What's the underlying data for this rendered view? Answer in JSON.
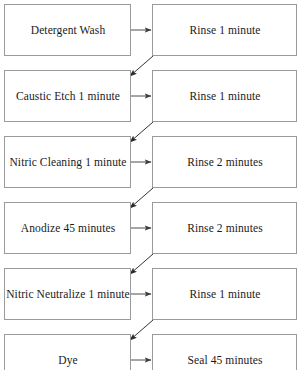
{
  "diagram": {
    "type": "flowchart",
    "orientation": "two-column-zigzag",
    "title_visible": false,
    "cropped_top": true,
    "cropped_bottom": true,
    "colors": {
      "box_border": "#9a9a9a",
      "box_fill": "#ffffff",
      "arrow": "#4d4d4d",
      "diagonal_arrow": "#333333",
      "text": "#1a1a1a",
      "background": "#ffffff"
    },
    "rows": [
      {
        "left": "Detergent Wash",
        "right": "Rinse 1 minute"
      },
      {
        "left": "Caustic Etch 1 minute",
        "right": "Rinse 1 minute"
      },
      {
        "left": "Nitric Cleaning 1 minute",
        "right": "Rinse 2 minutes"
      },
      {
        "left": "Anodize 45 minutes",
        "right": "Rinse 2 minutes"
      },
      {
        "left": "Nitric Neutralize 1 minute",
        "right": "Rinse 1 minute"
      },
      {
        "left": "Dye",
        "right": "Seal 45 minutes"
      }
    ],
    "connectors": {
      "horizontal_count": 6,
      "diagonal_count": 5,
      "horizontal_direction": "left-to-right",
      "diagonal_direction": "right-box-bottom to next-left-box-top"
    }
  }
}
